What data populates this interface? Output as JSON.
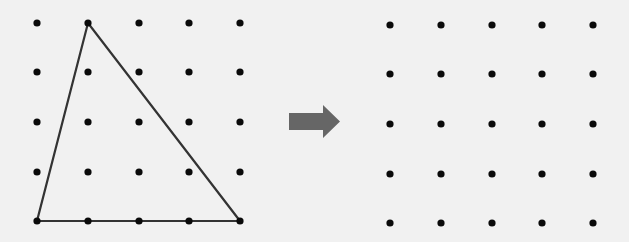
{
  "left_grid": {
    "xs": [
      37,
      88,
      139,
      189,
      240
    ],
    "ys": [
      23,
      72,
      122,
      172,
      221
    ],
    "dot_radius": 3.6,
    "dot_color": "#0a0a0a"
  },
  "triangle": {
    "points": [
      [
        88,
        23
      ],
      [
        37,
        221
      ],
      [
        240,
        221
      ]
    ],
    "stroke": "#333333",
    "stroke_width": 2.2
  },
  "arrow": {
    "color": "#666666",
    "shaft": {
      "x1": 289,
      "x2": 323,
      "y1": 113,
      "y2": 130
    },
    "head": {
      "x": 323,
      "tip_x": 340,
      "y_top": 105,
      "y_bottom": 138
    }
  },
  "right_grid": {
    "xs": [
      390,
      441,
      492,
      542,
      593
    ],
    "ys": [
      25,
      74,
      124,
      174,
      223
    ],
    "dot_radius": 3.6,
    "dot_color": "#0a0a0a"
  },
  "background": "#f1f1f1"
}
